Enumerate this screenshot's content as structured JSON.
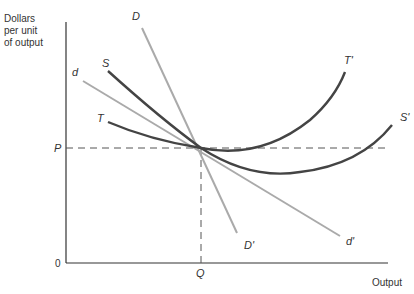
{
  "diagram": {
    "y_axis_label_lines": [
      "Dollars",
      "per unit",
      "of output"
    ],
    "x_axis_label": "Output",
    "origin_label": "0",
    "price_label": "P",
    "quantity_label": "Q",
    "curves": [
      {
        "id": "D",
        "start_label": "D",
        "end_label": "D'",
        "kind": "steep demand line",
        "color": "#aaaaaa"
      },
      {
        "id": "d",
        "start_label": "d",
        "end_label": "d'",
        "kind": "flatter demand line",
        "color": "#aaaaaa"
      },
      {
        "id": "S",
        "start_label": "S",
        "end_label": "S'",
        "kind": "U-shaped cost curve",
        "color": "#444444"
      },
      {
        "id": "T",
        "start_label": "T",
        "end_label": "T'",
        "kind": "U-shaped cost curve",
        "color": "#444444"
      }
    ],
    "colors": {
      "axis": "#333333",
      "dark_curve": "#444444",
      "light_curve": "#aaaaaa",
      "dashed": "#555555"
    }
  }
}
